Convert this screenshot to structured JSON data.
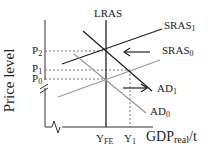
{
  "diagram": {
    "y_axis_label": "Price level",
    "x_axis_label": {
      "main": "GDP",
      "sub": "real",
      "suffix": "/t"
    },
    "curves": {
      "lras": "LRAS",
      "sras1": {
        "main": "SRAS",
        "sub": "1"
      },
      "sras0": {
        "main": "SRAS",
        "sub": "0"
      },
      "ad1": {
        "main": "AD",
        "sub": "1"
      },
      "ad0": {
        "main": "AD",
        "sub": "0"
      }
    },
    "price_ticks": [
      {
        "main": "P",
        "sub": "2"
      },
      {
        "main": "P",
        "sub": "1"
      },
      {
        "main": "P",
        "sub": "0"
      }
    ],
    "quantity_ticks": [
      {
        "main": "Y",
        "sub": "FE"
      },
      {
        "main": "Y",
        "sub": "1"
      }
    ],
    "colors": {
      "dark": "#222222",
      "light": "#999999"
    }
  }
}
